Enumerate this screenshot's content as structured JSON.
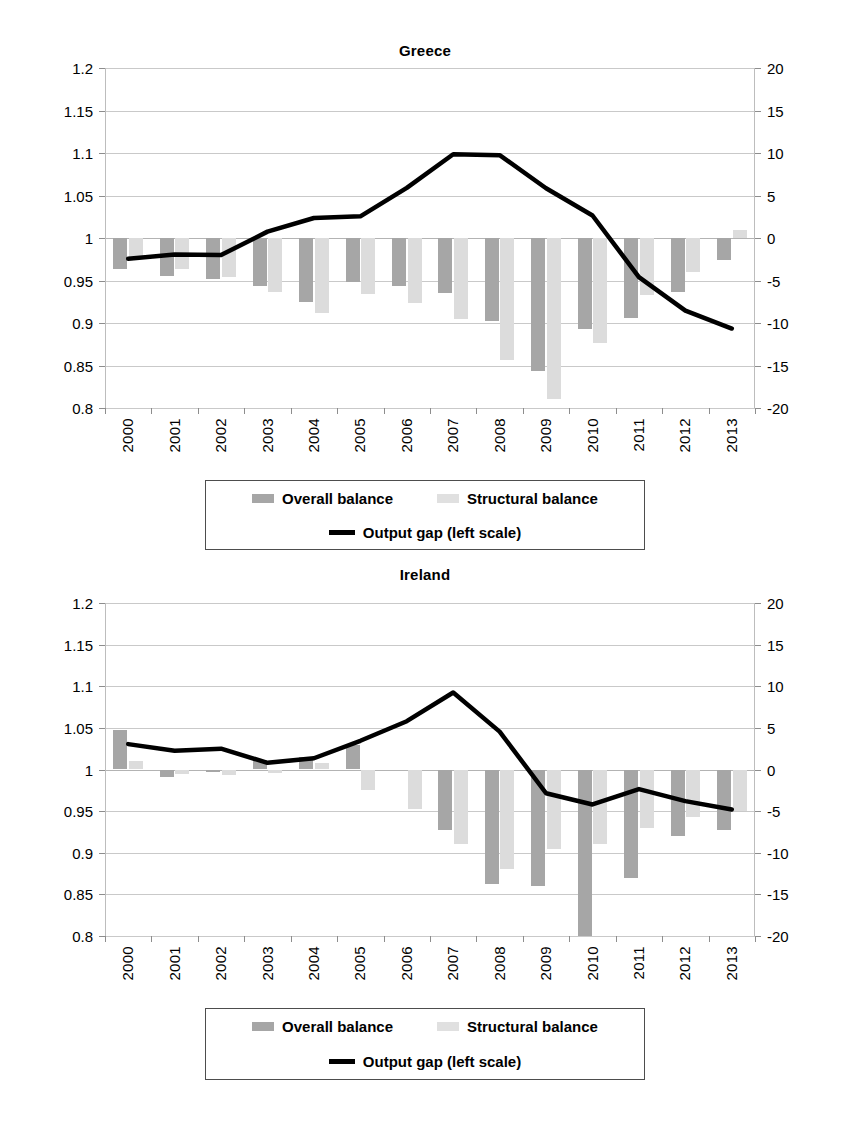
{
  "figure": {
    "panels": [
      "greece",
      "ireland"
    ]
  },
  "legend": {
    "overall_label": "Overall balance",
    "structural_label": "Structural balance",
    "line_label": "Output gap (left scale)"
  },
  "colors": {
    "overall": "#a6a6a6",
    "structural": "#dcdcdc",
    "line": "#000000",
    "grid": "#c9c9c9",
    "axis": "#bdbdbd"
  },
  "chart_data": [
    {
      "type": "bar",
      "title": "Greece",
      "xlabel": "",
      "ylabel": "",
      "categories": [
        "2000",
        "2001",
        "2002",
        "2003",
        "2004",
        "2005",
        "2006",
        "2007",
        "2008",
        "2009",
        "2010",
        "2011",
        "2012",
        "2013"
      ],
      "left_axis": {
        "ticks": [
          "0.8",
          "0.85",
          "0.9",
          "0.95",
          "1",
          "1.05",
          "1.1",
          "1.15",
          "1.2"
        ],
        "min": 0.8,
        "max": 1.2,
        "step": 0.05
      },
      "right_axis": {
        "ticks": [
          "-20",
          "-15",
          "-10",
          "-5",
          "0",
          "5",
          "10",
          "15",
          "20"
        ],
        "min": -20,
        "max": 20,
        "step": 5
      },
      "grid": true,
      "legend_position": "below",
      "series": [
        {
          "name": "Overall balance",
          "kind": "bar",
          "axis": "right",
          "values": [
            -3.7,
            -4.5,
            -4.8,
            -5.6,
            -7.5,
            -5.2,
            -5.7,
            -6.5,
            -9.8,
            -15.6,
            -10.7,
            -9.4,
            -6.3,
            -2.6
          ]
        },
        {
          "name": "Structural balance",
          "kind": "bar",
          "axis": "right",
          "values": [
            -2.4,
            -3.7,
            -4.6,
            -6.3,
            -8.8,
            -6.6,
            -7.6,
            -9.5,
            -14.3,
            -18.9,
            -12.4,
            -6.7,
            -4.0,
            0.9
          ]
        },
        {
          "name": "Output gap (left scale)",
          "kind": "line",
          "axis": "left",
          "values": [
            0.9755,
            0.9805,
            0.98,
            1.0075,
            1.0235,
            1.0255,
            1.059,
            1.0985,
            1.0975,
            1.0585,
            1.0265,
            0.954,
            0.9145,
            0.8935
          ]
        }
      ]
    },
    {
      "type": "bar",
      "title": "Ireland",
      "xlabel": "",
      "ylabel": "",
      "categories": [
        "2000",
        "2001",
        "2002",
        "2003",
        "2004",
        "2005",
        "2006",
        "2007",
        "2008",
        "2009",
        "2010",
        "2011",
        "2012",
        "2013"
      ],
      "left_axis": {
        "ticks": [
          "0.8",
          "0.85",
          "0.9",
          "0.95",
          "1",
          "1.05",
          "1.1",
          "1.15",
          "1.2"
        ],
        "min": 0.8,
        "max": 1.2,
        "step": 0.05
      },
      "right_axis": {
        "ticks": [
          "-20",
          "-15",
          "-10",
          "-5",
          "0",
          "5",
          "10",
          "15",
          "20"
        ],
        "min": -20,
        "max": 20,
        "step": 5
      },
      "grid": true,
      "legend_position": "below",
      "series": [
        {
          "name": "Overall balance",
          "kind": "bar",
          "axis": "right",
          "values": [
            4.7,
            -0.9,
            -0.3,
            1.2,
            1.5,
            3.0,
            0.0,
            -7.3,
            -13.7,
            -14.0,
            -31.0,
            -13.0,
            -8.0,
            -7.3
          ]
        },
        {
          "name": "Structural balance",
          "kind": "bar",
          "axis": "right",
          "values": [
            1.0,
            -0.5,
            -0.7,
            -0.4,
            0.8,
            -2.5,
            -4.8,
            -9.0,
            -12.0,
            -9.5,
            -9.0,
            -7.0,
            -5.7,
            -5.0
          ]
        },
        {
          "name": "Output gap (left scale)",
          "kind": "line",
          "axis": "left",
          "values": [
            1.0305,
            1.0225,
            1.025,
            1.008,
            1.0135,
            1.0345,
            1.058,
            1.0925,
            1.0455,
            0.9715,
            0.958,
            0.9765,
            0.962,
            0.952
          ]
        }
      ]
    }
  ]
}
